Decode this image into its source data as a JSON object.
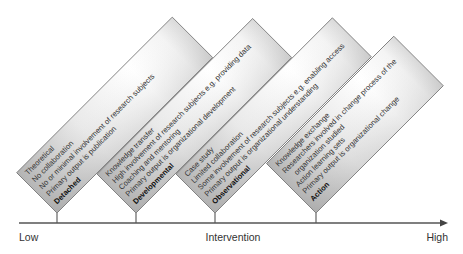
{
  "axis": {
    "low_label": "Low",
    "mid_label": "Intervention",
    "high_label": "High"
  },
  "boxes": [
    {
      "title": "Detached",
      "lines": [
        "Theoretical",
        "No collaboration",
        "No or minimal involvement of research subjects",
        "Primary output is publication"
      ]
    },
    {
      "title": "Developmental",
      "lines": [
        "Knowledge transfer",
        "High involvement of research subjects e.g. providing data",
        "Coaching and mentoring",
        "Primary output is organizational development"
      ]
    },
    {
      "title": "Observational",
      "lines": [
        "Case study",
        "Limited collaboration",
        "Some involvement of research subjects e.g. enabling access",
        "Primary output is organizational understanding"
      ]
    },
    {
      "title": "Action",
      "lines": [
        "Knowledge exchange",
        "Researchers involved in change process of the",
        "organization studied",
        "Action learning sets",
        "Primary output is organizational change"
      ]
    }
  ],
  "colors": {
    "axis": "#555555",
    "box_border": "#6e6e6e",
    "box_shade": "#b4b4b4",
    "box_light": "#ffffff"
  }
}
